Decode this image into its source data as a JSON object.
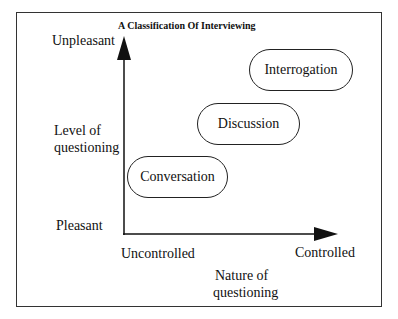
{
  "diagram": {
    "title": "A Classification Of Interviewing",
    "y_axis": {
      "top_label": "Unpleasant",
      "name_line1": "Level of",
      "name_line2": "questioning",
      "bottom_label": "Pleasant"
    },
    "x_axis": {
      "left_label": "Uncontrolled",
      "right_label": "Controlled",
      "name_line1": "Nature of",
      "name_line2": "questioning"
    },
    "nodes": [
      {
        "label": "Conversation"
      },
      {
        "label": "Discussion"
      },
      {
        "label": "Interrogation"
      }
    ],
    "colors": {
      "line": "#111111",
      "frame": "#333333",
      "background": "#ffffff"
    }
  }
}
